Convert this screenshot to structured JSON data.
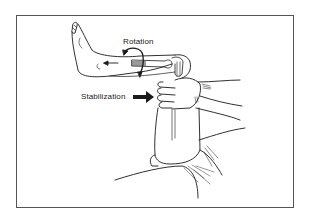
{
  "figure": {
    "labels": {
      "rotation": "Rotation",
      "stabilization": "Stabilization"
    },
    "icons": {
      "rotation_arrow": "curved-rotation-arrow-icon",
      "stabilization_arrow": "bold-right-arrow-icon",
      "direction_arrow": "left-arrow-icon"
    },
    "colors": {
      "line": "#1a1a1a",
      "frame": "#555555",
      "background": "#ffffff"
    }
  }
}
